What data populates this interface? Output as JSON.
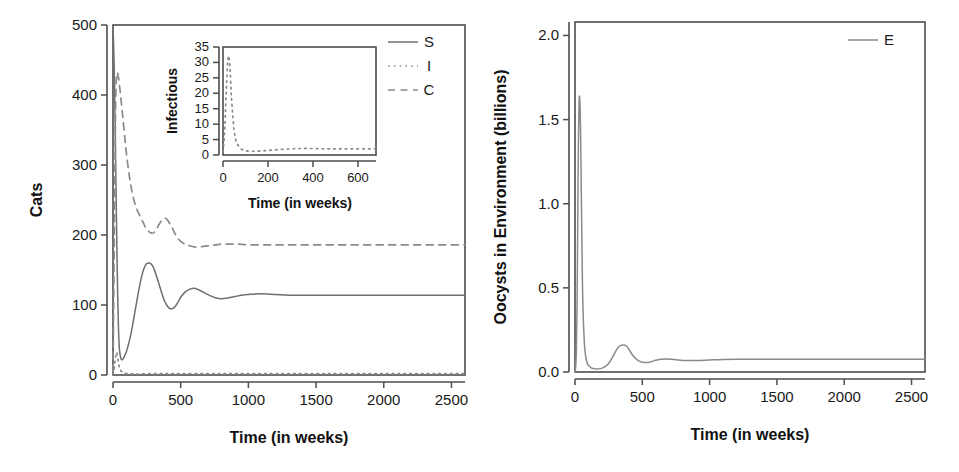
{
  "figure": {
    "panels": [
      "cats-panel",
      "oocysts-panel"
    ],
    "background_color": "#ffffff",
    "line_color": "#6e6e6e",
    "axis_color": "#4d4d4d",
    "text_color": "#1a1a1a"
  },
  "chart_data": [
    {
      "id": "cats-panel",
      "type": "line",
      "title": "",
      "xlabel": "Time (in weeks)",
      "ylabel": "Cats",
      "xlim": [
        0,
        2600
      ],
      "ylim": [
        0,
        500
      ],
      "xticks": [
        0,
        500,
        1000,
        1500,
        2000,
        2500
      ],
      "xtick_labels": [
        "0",
        "500",
        "1000",
        "1500",
        "2000",
        "2500"
      ],
      "yticks": [
        0,
        100,
        200,
        300,
        400,
        500
      ],
      "ytick_labels": [
        "0",
        "100",
        "200",
        "300",
        "400",
        "500"
      ],
      "grid": false,
      "legend_position": "top-right",
      "legend": [
        "S",
        "I",
        "C"
      ],
      "series": [
        {
          "name": "S",
          "label": "S",
          "style": "solid",
          "color": "#6e6e6e",
          "x": [
            0,
            5,
            10,
            15,
            20,
            25,
            30,
            35,
            40,
            45,
            50,
            60,
            70,
            80,
            100,
            120,
            140,
            160,
            180,
            200,
            220,
            240,
            260,
            280,
            300,
            320,
            340,
            360,
            380,
            400,
            420,
            440,
            460,
            480,
            500,
            530,
            560,
            600,
            640,
            680,
            720,
            760,
            800,
            850,
            900,
            950,
            1000,
            1100,
            1200,
            1300,
            1400,
            1600,
            1800,
            2000,
            2200,
            2400,
            2600
          ],
          "y": [
            495,
            470,
            430,
            370,
            300,
            230,
            165,
            110,
            70,
            45,
            32,
            23,
            22,
            25,
            34,
            48,
            66,
            88,
            110,
            131,
            147,
            157,
            160,
            159,
            153,
            142,
            130,
            117,
            106,
            99,
            95,
            95,
            98,
            104,
            111,
            118,
            122,
            124,
            121,
            117,
            113,
            110,
            109,
            110,
            112,
            114,
            115,
            116,
            115,
            114,
            114,
            114,
            114,
            114,
            114,
            114,
            114
          ]
        },
        {
          "name": "I",
          "label": "I",
          "style": "dotted",
          "color": "#8a8a8a",
          "x": [
            0,
            5,
            10,
            15,
            20,
            25,
            30,
            40,
            50,
            70,
            100,
            150,
            200,
            300,
            400,
            500,
            700,
            900,
            1200,
            1600,
            2000,
            2400,
            2600
          ],
          "y": [
            1,
            4,
            10,
            19,
            27,
            32,
            30,
            18,
            9,
            4,
            2,
            1.5,
            1.5,
            2,
            2,
            2,
            2,
            2,
            2,
            2,
            2,
            2,
            2
          ]
        },
        {
          "name": "C",
          "label": "C",
          "style": "dashed",
          "color": "#8a8a8a",
          "x": [
            0,
            10,
            20,
            30,
            40,
            50,
            60,
            70,
            80,
            90,
            100,
            120,
            140,
            160,
            180,
            200,
            220,
            240,
            260,
            280,
            300,
            320,
            340,
            360,
            380,
            400,
            420,
            440,
            460,
            480,
            500,
            530,
            560,
            600,
            640,
            680,
            720,
            760,
            800,
            860,
            920,
            1000,
            1100,
            1200,
            1400,
            1600,
            1800,
            2000,
            2200,
            2400,
            2600
          ],
          "y": [
            5,
            200,
            390,
            430,
            425,
            410,
            392,
            373,
            353,
            333,
            315,
            285,
            262,
            246,
            235,
            227,
            219,
            211,
            206,
            203,
            203,
            208,
            215,
            221,
            224,
            222,
            216,
            209,
            201,
            195,
            191,
            187,
            185,
            183,
            183,
            184,
            185,
            186,
            187,
            187,
            187,
            186,
            186,
            186,
            186,
            186,
            186,
            186,
            186,
            186,
            186
          ]
        }
      ],
      "inset": {
        "id": "infectious-inset",
        "type": "line",
        "xlabel": "Time (in weeks)",
        "ylabel": "Infectious",
        "xlim": [
          0,
          680
        ],
        "ylim": [
          0,
          35
        ],
        "xticks": [
          0,
          200,
          400,
          600
        ],
        "xtick_labels": [
          "0",
          "200",
          "400",
          "600"
        ],
        "yticks": [
          0,
          5,
          10,
          15,
          20,
          25,
          30,
          35
        ],
        "ytick_labels": [
          "0",
          "5",
          "10",
          "15",
          "20",
          "25",
          "30",
          "35"
        ],
        "grid": false,
        "series": [
          {
            "name": "I",
            "style": "dotted",
            "color": "#8a8a8a",
            "x": [
              0,
              4,
              8,
              12,
              16,
              20,
              24,
              28,
              32,
              36,
              40,
              48,
              56,
              64,
              80,
              100,
              130,
              170,
              220,
              280,
              340,
              400,
              460,
              520,
              580,
              640,
              680
            ],
            "y": [
              1,
              4,
              9,
              16,
              23,
              29,
              32,
              31,
              27,
              21,
              16,
              9,
              5,
              3.5,
              2,
              1.4,
              1.2,
              1.3,
              1.6,
              1.9,
              2.1,
              2.1,
              2.0,
              2.0,
              2.0,
              2.0,
              2.0
            ]
          }
        ]
      }
    },
    {
      "id": "oocysts-panel",
      "type": "line",
      "title": "",
      "xlabel": "Time (in weeks)",
      "ylabel": "Oocysts in Environment (billions)",
      "xlim": [
        0,
        2600
      ],
      "ylim": [
        0,
        2.08
      ],
      "xticks": [
        0,
        500,
        1000,
        1500,
        2000,
        2500
      ],
      "xtick_labels": [
        "0",
        "500",
        "1000",
        "1500",
        "2000",
        "2500"
      ],
      "yticks": [
        0.0,
        0.5,
        1.0,
        1.5,
        2.0
      ],
      "ytick_labels": [
        "0.0",
        "0.5",
        "1.0",
        "1.5",
        "2.0"
      ],
      "grid": false,
      "legend_position": "top-right",
      "legend": [
        "E"
      ],
      "series": [
        {
          "name": "E",
          "label": "E",
          "style": "solid",
          "color": "#8a8a8a",
          "x": [
            0,
            5,
            10,
            15,
            20,
            25,
            30,
            35,
            40,
            45,
            50,
            55,
            60,
            70,
            80,
            90,
            100,
            120,
            140,
            160,
            190,
            220,
            250,
            280,
            300,
            320,
            340,
            360,
            375,
            390,
            410,
            430,
            450,
            470,
            500,
            530,
            560,
            600,
            640,
            680,
            720,
            760,
            800,
            860,
            920,
            1000,
            1100,
            1200,
            1400,
            1600,
            1800,
            2000,
            2200,
            2400,
            2600
          ],
          "y": [
            0.0,
            0.03,
            0.12,
            0.38,
            0.85,
            1.35,
            1.6,
            1.63,
            1.5,
            1.2,
            0.85,
            0.55,
            0.36,
            0.17,
            0.09,
            0.055,
            0.04,
            0.025,
            0.02,
            0.018,
            0.02,
            0.03,
            0.05,
            0.09,
            0.12,
            0.145,
            0.158,
            0.16,
            0.158,
            0.148,
            0.122,
            0.098,
            0.08,
            0.068,
            0.058,
            0.056,
            0.06,
            0.07,
            0.076,
            0.078,
            0.076,
            0.072,
            0.069,
            0.068,
            0.069,
            0.072,
            0.075,
            0.076,
            0.076,
            0.076,
            0.076,
            0.076,
            0.076,
            0.076,
            0.076
          ]
        }
      ]
    }
  ]
}
